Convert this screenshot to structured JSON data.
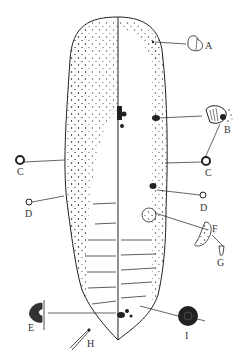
{
  "figure": {
    "type": "scientific illustration",
    "top_caption_cut": "",
    "colors": {
      "ink": "#222222",
      "stipple": "#444444",
      "background": "#ffffff",
      "label": "#333333"
    },
    "labels": [
      {
        "id": "A",
        "text": "A",
        "x": 205,
        "y": 46
      },
      {
        "id": "B",
        "text": "B",
        "x": 224,
        "y": 130
      },
      {
        "id": "C_right",
        "text": "C",
        "x": 208,
        "y": 170
      },
      {
        "id": "C_left",
        "text": "C",
        "x": 20,
        "y": 167
      },
      {
        "id": "D_left",
        "text": "D",
        "x": 26,
        "y": 208
      },
      {
        "id": "D_right",
        "text": "D",
        "x": 200,
        "y": 205
      },
      {
        "id": "F",
        "text": "F",
        "x": 212,
        "y": 226
      },
      {
        "id": "G",
        "text": "G",
        "x": 217,
        "y": 260
      },
      {
        "id": "E",
        "text": "E",
        "x": 28,
        "y": 322
      },
      {
        "id": "H",
        "text": "H",
        "x": 87,
        "y": 339
      },
      {
        "id": "I",
        "text": "I",
        "x": 185,
        "y": 329
      }
    ]
  }
}
